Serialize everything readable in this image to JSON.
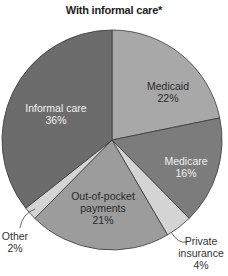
{
  "chart_data": {
    "type": "pie",
    "title": "With informal care*",
    "categories": [
      "Medicaid",
      "Medicare",
      "Private insurance",
      "Out-of-pocket payments",
      "Other",
      "Informal care"
    ],
    "values": [
      22,
      16,
      4,
      21,
      2,
      36
    ],
    "unit": "%",
    "start_angle_deg": 0,
    "direction": "clockwise",
    "colors": [
      "#a8a8a8",
      "#7c7c7c",
      "#d4d4d4",
      "#9c9c9c",
      "#d4d4d4",
      "#6c6c6c"
    ],
    "legend_position": "none",
    "labels": [
      {
        "name": "Medicaid",
        "lines": [
          "Medicaid",
          "22%"
        ],
        "x": 168,
        "y": 90,
        "color": "#2a2a2a"
      },
      {
        "name": "Medicare",
        "lines": [
          "Medicare",
          "16%"
        ],
        "x": 186,
        "y": 165,
        "color": "#f0f0f0"
      },
      {
        "name": "Private insurance",
        "lines": [
          "Private",
          "insurance",
          "4%"
        ],
        "x": 201,
        "y": 245,
        "color": "#333333",
        "leader": true
      },
      {
        "name": "Out-of-pocket payments",
        "lines": [
          "Out-of-pocket",
          "payments",
          "21%"
        ],
        "x": 103,
        "y": 200,
        "color": "#2a2a2a"
      },
      {
        "name": "Other",
        "lines": [
          "Other",
          "2%"
        ],
        "x": 15,
        "y": 240,
        "color": "#333333",
        "leader": true
      },
      {
        "name": "Informal care",
        "lines": [
          "Informal care",
          "36%"
        ],
        "x": 56,
        "y": 112,
        "color": "#f0f0f0"
      }
    ]
  }
}
